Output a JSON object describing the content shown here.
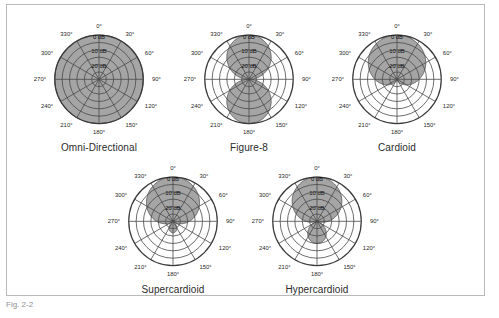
{
  "figure": {
    "caption": "Fig. 2-2",
    "background_color": "#ffffff",
    "border_color": "#b9b9b9",
    "pattern_fill_color": "#9d9d9d",
    "grid_color": "#4a4a4a"
  },
  "chart_data": {
    "type": "line",
    "projection": "polar",
    "grid": true,
    "legend_position": "none",
    "angle_unit": "degrees",
    "angle_ticks": [
      "0°",
      "30°",
      "60°",
      "90°",
      "120°",
      "150°",
      "180°",
      "210°",
      "240°",
      "270°",
      "300°",
      "330°"
    ],
    "angle_tick_values": [
      0,
      30,
      60,
      90,
      120,
      150,
      180,
      210,
      240,
      270,
      300,
      330
    ],
    "radial_ticks": [
      "0 dB",
      "10 dB",
      "20 dB"
    ],
    "radial_tick_values": [
      0,
      -10,
      -20
    ],
    "rlim": [
      -30,
      0
    ],
    "ylabel": "dB",
    "xlabel": "",
    "ring_count": 6,
    "ring_step_db": 5,
    "series": [
      {
        "name": "Omni-Directional",
        "equation": "r = 1",
        "coefficients": {
          "a": 1.0,
          "b": 0.0
        },
        "values": [
          1.0,
          1.0,
          1.0,
          1.0,
          1.0,
          1.0,
          1.0,
          1.0,
          1.0,
          1.0,
          1.0,
          1.0
        ]
      },
      {
        "name": "Figure-8",
        "equation": "r = |cos(theta)|",
        "coefficients": {
          "a": 0.0,
          "b": 1.0
        },
        "values": [
          1.0,
          0.866,
          0.5,
          0.0,
          0.5,
          0.866,
          1.0,
          0.866,
          0.5,
          0.0,
          0.5,
          0.866
        ]
      },
      {
        "name": "Cardioid",
        "equation": "r = 0.5 + 0.5 cos(theta)",
        "coefficients": {
          "a": 0.5,
          "b": 0.5
        },
        "values": [
          1.0,
          0.933,
          0.75,
          0.5,
          0.25,
          0.067,
          0.0,
          0.067,
          0.25,
          0.5,
          0.75,
          0.933
        ]
      },
      {
        "name": "Supercardioid",
        "equation": "r = 0.37 + 0.63 cos(theta)",
        "coefficients": {
          "a": 0.37,
          "b": 0.63
        },
        "values": [
          1.0,
          0.916,
          0.685,
          0.37,
          0.055,
          -0.176,
          -0.26,
          -0.176,
          0.055,
          0.37,
          0.685,
          0.916
        ]
      },
      {
        "name": "Hypercardioid",
        "equation": "r = 0.25 + 0.75 cos(theta)",
        "coefficients": {
          "a": 0.25,
          "b": 0.75
        },
        "values": [
          1.0,
          0.899,
          0.625,
          0.25,
          -0.125,
          -0.399,
          -0.5,
          -0.399,
          -0.125,
          0.25,
          0.625,
          0.899
        ]
      }
    ]
  },
  "plots": [
    {
      "id": "omni-directional",
      "caption": "Omni-Directional",
      "db_labels": [
        "0 dB",
        "10 dB",
        "20 dB"
      ],
      "angle_labels": [
        "0°",
        "30°",
        "60°",
        "90°",
        "120°",
        "150°",
        "180°",
        "210°",
        "240°",
        "270°",
        "300°",
        "330°"
      ]
    },
    {
      "id": "figure-8",
      "caption": "Figure-8",
      "db_labels": [
        "0 dB",
        "10 dB",
        "20 dB"
      ],
      "angle_labels": [
        "0°",
        "30°",
        "60°",
        "90°",
        "120°",
        "150°",
        "180°",
        "210°",
        "240°",
        "270°",
        "300°",
        "330°"
      ]
    },
    {
      "id": "cardioid",
      "caption": "Cardioid",
      "db_labels": [
        "0 dB",
        "10 dB",
        "20 dB"
      ],
      "angle_labels": [
        "0°",
        "30°",
        "60°",
        "90°",
        "120°",
        "150°",
        "180°",
        "210°",
        "240°",
        "270°",
        "300°",
        "330°"
      ]
    },
    {
      "id": "supercardioid",
      "caption": "Supercardioid",
      "db_labels": [
        "0 dB",
        "10 dB",
        "20 dB"
      ],
      "angle_labels": [
        "0°",
        "30°",
        "60°",
        "90°",
        "120°",
        "150°",
        "180°",
        "210°",
        "240°",
        "270°",
        "300°",
        "330°"
      ]
    },
    {
      "id": "hypercardioid",
      "caption": "Hypercardioid",
      "db_labels": [
        "0 dB",
        "10 dB",
        "20 dB"
      ],
      "angle_labels": [
        "0°",
        "30°",
        "60°",
        "90°",
        "120°",
        "150°",
        "180°",
        "210°",
        "240°",
        "270°",
        "300°",
        "330°"
      ]
    }
  ]
}
